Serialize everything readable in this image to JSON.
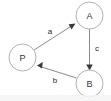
{
  "graph": {
    "title": "Directed graph P A B",
    "background_color": "#ffffff",
    "node_stroke_color": "#b0b0b0",
    "node_fill_color": "#ffffff",
    "edge_color": "#8a8a8a",
    "arrow_color": "#3a3a3a",
    "label_color": "#2b2b2b",
    "node_radius": 13.5,
    "nodes": [
      {
        "id": "A",
        "label": "A",
        "cx": 89.5,
        "cy": 15.5
      },
      {
        "id": "P",
        "label": "P",
        "cx": 22.5,
        "cy": 57.5
      },
      {
        "id": "B",
        "label": "B",
        "cx": 89.5,
        "cy": 83.5
      }
    ],
    "edges": [
      {
        "id": "P-to-A",
        "label": "a",
        "from": "P",
        "to": "A",
        "x1": 34.0,
        "y1": 50.0,
        "x2": 75.5,
        "y2": 23.5,
        "label_x": 50,
        "label_y": 31,
        "arrow_angle_deg": -32.6
      },
      {
        "id": "A-to-B",
        "label": "c",
        "from": "A",
        "to": "B",
        "x1": 89.5,
        "y1": 29.0,
        "x2": 89.5,
        "y2": 70.0,
        "label_x": 97,
        "label_y": 48,
        "arrow_angle_deg": 90
      },
      {
        "id": "B-to-P",
        "label": "b",
        "from": "B",
        "to": "P",
        "x1": 76.5,
        "y1": 78.0,
        "x2": 37.5,
        "y2": 65.5,
        "label_x": 55,
        "label_y": 80,
        "arrow_angle_deg": 197.8
      }
    ],
    "bottom_band": {
      "present": true,
      "color": "#f4f4f4"
    }
  }
}
